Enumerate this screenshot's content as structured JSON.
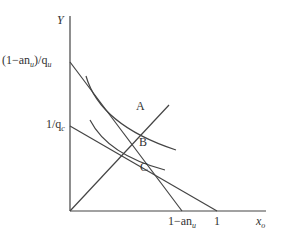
{
  "diagram": {
    "axes": {
      "y_label": "Y",
      "x_label": "x",
      "x_label_sub": "o"
    },
    "y_ticks": [
      {
        "num": "(1−an",
        "sub": "u",
        "mid": ")/q",
        "sub2": "u"
      },
      {
        "num": "1/q",
        "sub": "c"
      }
    ],
    "x_ticks": [
      {
        "num": "1−an",
        "sub": "u"
      },
      {
        "num": "1"
      }
    ],
    "points": [
      "A",
      "B",
      "C"
    ],
    "colors": {
      "line": "#444444",
      "text": "#333333",
      "background": "#ffffff"
    }
  }
}
